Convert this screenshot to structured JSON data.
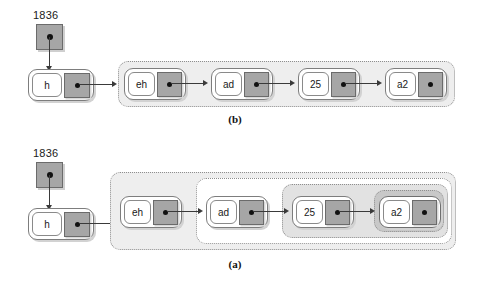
{
  "figure": {
    "type": "linked-list-diagram",
    "background_color": "#ffffff",
    "accent_gray": "#a6a6a6",
    "container_border_color": "#8e8e8e",
    "arrow_color": "#3a3a3a"
  },
  "panels": [
    {
      "id": "panel-b",
      "caption": "(b)",
      "root_pointer": {
        "label": "1836",
        "cell_name": "root-pointer-cell"
      },
      "head_node": {
        "key": "h"
      },
      "nodes": [
        {
          "key": "eh"
        },
        {
          "key": "ad"
        },
        {
          "key": "25"
        },
        {
          "key": "a2"
        }
      ],
      "containers": [
        {
          "name": "container-all",
          "fill": "#eeeeee",
          "covers": [
            "eh",
            "ad",
            "25",
            "a2"
          ]
        }
      ]
    },
    {
      "id": "panel-a",
      "caption": "(a)",
      "root_pointer": {
        "label": "1836",
        "cell_name": "root-pointer-cell"
      },
      "head_node": {
        "key": "h"
      },
      "nodes": [
        {
          "key": "eh"
        },
        {
          "key": "ad"
        },
        {
          "key": "25"
        },
        {
          "key": "a2"
        }
      ],
      "containers": [
        {
          "name": "container-level-1",
          "fill": "#eeeeee",
          "covers": [
            "eh",
            "ad",
            "25",
            "a2"
          ]
        },
        {
          "name": "container-level-2",
          "fill": "#ffffff",
          "covers": [
            "ad",
            "25",
            "a2"
          ]
        },
        {
          "name": "container-level-3",
          "fill": "#e2e2e2",
          "covers": [
            "25",
            "a2"
          ]
        },
        {
          "name": "container-level-4",
          "fill": "#c8c8c8",
          "covers": [
            "a2"
          ]
        }
      ]
    }
  ]
}
